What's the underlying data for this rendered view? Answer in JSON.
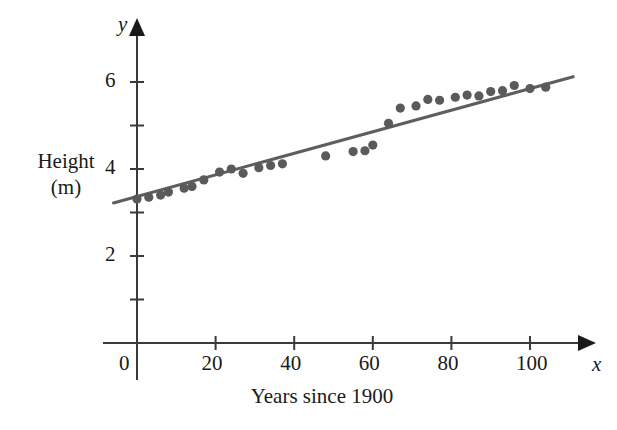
{
  "chart_data": {
    "type": "scatter",
    "title": "",
    "xlabel": "Years since 1900",
    "ylabel": "Height (m)",
    "ylabel_line1": "Height",
    "ylabel_line2": "(m)",
    "x_axis_symbol": "x",
    "y_axis_symbol": "y",
    "xlim": [
      -8,
      112
    ],
    "ylim": [
      0,
      6.9
    ],
    "x_ticks": [
      0,
      20,
      40,
      60,
      80,
      100
    ],
    "x_tick_labels": [
      "0",
      "20",
      "40",
      "60",
      "80",
      "100"
    ],
    "y_ticks": [
      1,
      2,
      3,
      4,
      5,
      6
    ],
    "y_tick_labels": [
      "",
      "2",
      "",
      "4",
      "",
      "6"
    ],
    "y_labeled_ticks": [
      2,
      4,
      6
    ],
    "grid": false,
    "legend": false,
    "point_color": "#5a5a5a",
    "line_color": "#5e5e5e",
    "axis_color": "#3a3a3a",
    "series": [
      {
        "name": "Pole vault world record height",
        "type": "scatter",
        "points": [
          [
            0,
            3.31
          ],
          [
            3,
            3.35
          ],
          [
            6,
            3.4
          ],
          [
            8,
            3.47
          ],
          [
            12,
            3.56
          ],
          [
            14,
            3.6
          ],
          [
            17,
            3.75
          ],
          [
            21,
            3.93
          ],
          [
            24,
            4.0
          ],
          [
            27,
            3.9
          ],
          [
            31,
            4.03
          ],
          [
            34,
            4.08
          ],
          [
            37,
            4.12
          ],
          [
            48,
            4.3
          ],
          [
            55,
            4.4
          ],
          [
            58,
            4.42
          ],
          [
            60,
            4.55
          ],
          [
            64,
            5.05
          ],
          [
            67,
            5.4
          ],
          [
            71,
            5.45
          ],
          [
            74,
            5.6
          ],
          [
            77,
            5.58
          ],
          [
            81,
            5.65
          ],
          [
            84,
            5.7
          ],
          [
            87,
            5.68
          ],
          [
            90,
            5.78
          ],
          [
            93,
            5.8
          ],
          [
            96,
            5.92
          ],
          [
            100,
            5.85
          ],
          [
            104,
            5.88
          ]
        ]
      },
      {
        "name": "Least-squares regression line",
        "type": "line",
        "endpoints": [
          [
            -6,
            3.22
          ],
          [
            111,
            6.12
          ]
        ]
      }
    ]
  },
  "figure": {
    "name": "scatter-plot-with-regression-line"
  }
}
